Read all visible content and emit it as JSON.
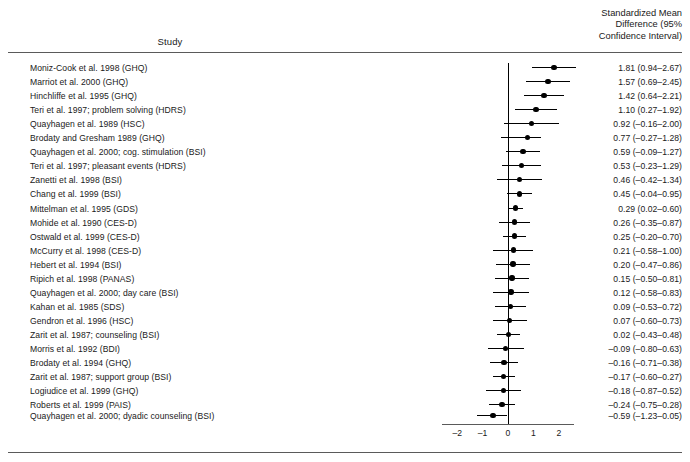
{
  "header": {
    "study_column": "Study",
    "smd_column_lines": [
      "Standardized Mean",
      "Difference (95%",
      "Confidence Interval)"
    ]
  },
  "chart_data": {
    "type": "forest",
    "title": "",
    "xlabel": "",
    "ylabel": "",
    "xlim": [
      -2.6,
      2.6
    ],
    "axis_ticks": [
      -2,
      -1,
      0,
      1,
      2
    ],
    "axis_tick_labels": [
      "–2",
      "–1",
      "0",
      "1",
      "2"
    ],
    "null_value": 0,
    "grid": false,
    "legend": "none",
    "effect_measure": "Standardized Mean Difference",
    "confidence_level": "95%",
    "studies": [
      {
        "label": "Moniz-Cook et al. 1998 (GHQ)",
        "estimate": 1.81,
        "ci_low": 0.94,
        "ci_high": 2.67,
        "text": "1.81 (0.94–2.67)"
      },
      {
        "label": "Marriot et al. 2000 (GHQ)",
        "estimate": 1.57,
        "ci_low": 0.69,
        "ci_high": 2.45,
        "text": "1.57 (0.69–2.45)"
      },
      {
        "label": "Hinchliffe et al. 1995 (GHQ)",
        "estimate": 1.42,
        "ci_low": 0.64,
        "ci_high": 2.21,
        "text": "1.42 (0.64–2.21)"
      },
      {
        "label": "Teri et al. 1997; problem solving (HDRS)",
        "estimate": 1.1,
        "ci_low": 0.27,
        "ci_high": 1.92,
        "text": "1.10 (0.27–1.92)"
      },
      {
        "label": "Quayhagen et al. 1989 (HSC)",
        "estimate": 0.92,
        "ci_low": -0.16,
        "ci_high": 2.0,
        "text": "0.92 (–0.16–2.00)"
      },
      {
        "label": "Brodaty and Gresham 1989 (GHQ)",
        "estimate": 0.77,
        "ci_low": -0.27,
        "ci_high": 1.28,
        "text": "0.77 (–0.27–1.28)"
      },
      {
        "label": "Quayhagen et al. 2000; cog. stimulation (BSI)",
        "estimate": 0.59,
        "ci_low": -0.09,
        "ci_high": 1.27,
        "text": "0.59 (–0.09–1.27)"
      },
      {
        "label": "Teri et al. 1997; pleasant events (HDRS)",
        "estimate": 0.53,
        "ci_low": -0.23,
        "ci_high": 1.29,
        "text": "0.53 (–0.23–1.29)"
      },
      {
        "label": "Zanetti et al. 1998 (BSI)",
        "estimate": 0.46,
        "ci_low": -0.42,
        "ci_high": 1.34,
        "text": "0.46 (–0.42–1.34)"
      },
      {
        "label": "Chang et al. 1999 (BSI)",
        "estimate": 0.45,
        "ci_low": -0.04,
        "ci_high": 0.95,
        "text": "0.45 (–0.04–0.95)"
      },
      {
        "label": "Mittelman et al. 1995 (GDS)",
        "estimate": 0.29,
        "ci_low": 0.02,
        "ci_high": 0.6,
        "text": "0.29 (0.02–0.60)"
      },
      {
        "label": "Mohide et al. 1990 (CES-D)",
        "estimate": 0.26,
        "ci_low": -0.35,
        "ci_high": 0.87,
        "text": "0.26 (–0.35–0.87)"
      },
      {
        "label": "Ostwald et al. 1999 (CES-D)",
        "estimate": 0.25,
        "ci_low": -0.2,
        "ci_high": 0.7,
        "text": "0.25 (–0.20–0.70)"
      },
      {
        "label": "McCurry et al. 1998 (CES-D)",
        "estimate": 0.21,
        "ci_low": -0.58,
        "ci_high": 1.0,
        "text": "0.21 (–0.58–1.00)"
      },
      {
        "label": "Hebert et al. 1994 (BSI)",
        "estimate": 0.2,
        "ci_low": -0.47,
        "ci_high": 0.86,
        "text": "0.20 (–0.47–0.86)"
      },
      {
        "label": "Ripich et al. 1998 (PANAS)",
        "estimate": 0.15,
        "ci_low": -0.5,
        "ci_high": 0.81,
        "text": "0.15 (–0.50–0.81)"
      },
      {
        "label": "Quayhagen et al. 2000; day care (BSI)",
        "estimate": 0.12,
        "ci_low": -0.58,
        "ci_high": 0.83,
        "text": "0.12 (–0.58–0.83)"
      },
      {
        "label": "Kahan et al. 1985 (SDS)",
        "estimate": 0.09,
        "ci_low": -0.53,
        "ci_high": 0.72,
        "text": "0.09 (–0.53–0.72)"
      },
      {
        "label": "Gendron et al. 1996 (HSC)",
        "estimate": 0.07,
        "ci_low": -0.6,
        "ci_high": 0.73,
        "text": "0.07 (–0.60–0.73)"
      },
      {
        "label": "Zarit et al. 1987; counseling (BSI)",
        "estimate": 0.02,
        "ci_low": -0.43,
        "ci_high": 0.48,
        "text": "0.02 (–0.43–0.48)"
      },
      {
        "label": "Morris et al. 1992 (BDI)",
        "estimate": -0.09,
        "ci_low": -0.8,
        "ci_high": 0.63,
        "text": "–0.09 (–0.80–0.63)"
      },
      {
        "label": "Brodaty et al. 1994 (GHQ)",
        "estimate": -0.16,
        "ci_low": -0.71,
        "ci_high": 0.38,
        "text": "–0.16 (–0.71–0.38)"
      },
      {
        "label": "Zarit et al. 1987; support group (BSI)",
        "estimate": -0.17,
        "ci_low": -0.6,
        "ci_high": 0.27,
        "text": "–0.17 (–0.60–0.27)"
      },
      {
        "label": "Logiudice et al. 1999 (GHQ)",
        "estimate": -0.18,
        "ci_low": -0.87,
        "ci_high": 0.52,
        "text": "–0.18 (–0.87–0.52)"
      },
      {
        "label": "Roberts et al. 1999 (PAIS)",
        "estimate": -0.24,
        "ci_low": -0.75,
        "ci_high": 0.28,
        "text": "–0.24 (–0.75–0.28)"
      },
      {
        "label": "Quayhagen et al. 2000; dyadic counseling (BSI)",
        "estimate": -0.59,
        "ci_low": -1.23,
        "ci_high": -0.05,
        "text": "–0.59 (–1.23–0.05)"
      }
    ]
  }
}
